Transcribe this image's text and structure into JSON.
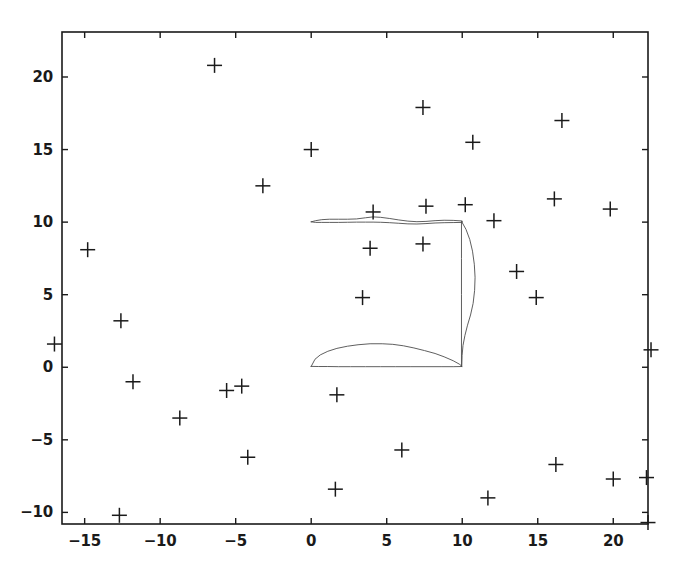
{
  "chart_data": {
    "type": "scatter",
    "title": "",
    "xlabel": "",
    "ylabel": "",
    "grid": false,
    "legend": null,
    "marker": "plus",
    "marker_color": "#1a1a1a",
    "line_color": "#4d4d4d",
    "frame_color": "#1a1a1a",
    "xlim": [
      -16.5,
      22.3
    ],
    "ylim": [
      -10.8,
      23.1
    ],
    "xticks": [
      -15,
      -10,
      -5,
      0,
      5,
      10,
      15,
      20
    ],
    "yticks": [
      -10,
      -5,
      0,
      5,
      10,
      15,
      20
    ],
    "xticklabels": [
      "-15",
      "-10",
      "-5",
      "0",
      "5",
      "10",
      "15",
      "20"
    ],
    "yticklabels": [
      "-10",
      "-5",
      "0",
      "5",
      "10",
      "15",
      "20"
    ],
    "points": [
      [
        -6.4,
        20.8
      ],
      [
        7.4,
        17.9
      ],
      [
        16.6,
        17.0
      ],
      [
        0.0,
        15.0
      ],
      [
        10.7,
        15.5
      ],
      [
        -3.2,
        12.5
      ],
      [
        4.1,
        10.7
      ],
      [
        7.6,
        11.1
      ],
      [
        10.2,
        11.2
      ],
      [
        16.1,
        11.6
      ],
      [
        19.8,
        10.9
      ],
      [
        12.1,
        10.1
      ],
      [
        -14.8,
        8.1
      ],
      [
        3.9,
        8.2
      ],
      [
        7.4,
        8.5
      ],
      [
        13.6,
        6.6
      ],
      [
        3.4,
        4.8
      ],
      [
        14.9,
        4.8
      ],
      [
        -12.6,
        3.2
      ],
      [
        -17.0,
        1.6
      ],
      [
        22.5,
        1.2
      ],
      [
        -11.8,
        -1.0
      ],
      [
        -5.6,
        -1.6
      ],
      [
        -4.6,
        -1.3
      ],
      [
        1.7,
        -1.9
      ],
      [
        -8.7,
        -3.5
      ],
      [
        -4.2,
        -6.2
      ],
      [
        6.0,
        -5.7
      ],
      [
        16.2,
        -6.7
      ],
      [
        1.6,
        -8.4
      ],
      [
        11.7,
        -9.0
      ],
      [
        20.0,
        -7.7
      ],
      [
        22.2,
        -7.6
      ],
      [
        -12.7,
        -10.2
      ],
      [
        22.3,
        -10.7
      ]
    ],
    "shapes": [
      {
        "name": "upper-airfoil-outline",
        "description": "thin near-flat airfoil along y=10 from x=0 to x=10",
        "closed": true,
        "points": [
          [
            0.0,
            10.02
          ],
          [
            0.3,
            10.1
          ],
          [
            0.7,
            10.17
          ],
          [
            1.2,
            10.2
          ],
          [
            1.8,
            10.2
          ],
          [
            2.4,
            10.2
          ],
          [
            3.0,
            10.22
          ],
          [
            3.6,
            10.3
          ],
          [
            4.1,
            10.36
          ],
          [
            4.6,
            10.33
          ],
          [
            5.2,
            10.25
          ],
          [
            5.8,
            10.15
          ],
          [
            6.4,
            10.07
          ],
          [
            7.0,
            10.03
          ],
          [
            7.6,
            10.05
          ],
          [
            8.2,
            10.1
          ],
          [
            8.8,
            10.13
          ],
          [
            9.4,
            10.12
          ],
          [
            10.0,
            10.08
          ],
          [
            10.0,
            9.98
          ],
          [
            9.4,
            9.97
          ],
          [
            8.8,
            9.96
          ],
          [
            8.2,
            9.94
          ],
          [
            7.6,
            9.9
          ],
          [
            7.0,
            9.87
          ],
          [
            6.4,
            9.88
          ],
          [
            5.8,
            9.92
          ],
          [
            5.2,
            9.96
          ],
          [
            4.6,
            9.99
          ],
          [
            4.1,
            10.0
          ],
          [
            3.6,
            10.0
          ],
          [
            3.0,
            10.0
          ],
          [
            2.4,
            9.99
          ],
          [
            1.8,
            9.98
          ],
          [
            1.2,
            9.98
          ],
          [
            0.7,
            9.98
          ],
          [
            0.3,
            9.98
          ],
          [
            0.0,
            10.02
          ]
        ]
      },
      {
        "name": "lower-airfoil-outline",
        "description": "cambered airfoil section along y=0 from x=0 to x=10",
        "closed": true,
        "points": [
          [
            0.0,
            0.06
          ],
          [
            0.25,
            0.55
          ],
          [
            0.6,
            0.85
          ],
          [
            1.1,
            1.1
          ],
          [
            1.7,
            1.3
          ],
          [
            2.4,
            1.45
          ],
          [
            3.1,
            1.55
          ],
          [
            3.9,
            1.62
          ],
          [
            4.7,
            1.62
          ],
          [
            5.4,
            1.58
          ],
          [
            6.1,
            1.48
          ],
          [
            6.8,
            1.33
          ],
          [
            7.5,
            1.15
          ],
          [
            8.2,
            0.95
          ],
          [
            8.8,
            0.72
          ],
          [
            9.4,
            0.45
          ],
          [
            9.8,
            0.22
          ],
          [
            10.0,
            0.05
          ],
          [
            9.4,
            0.04
          ],
          [
            8.6,
            0.04
          ],
          [
            7.6,
            0.04
          ],
          [
            6.6,
            0.04
          ],
          [
            5.6,
            0.04
          ],
          [
            4.6,
            0.04
          ],
          [
            3.6,
            0.04
          ],
          [
            2.6,
            0.04
          ],
          [
            1.8,
            0.04
          ],
          [
            1.1,
            0.05
          ],
          [
            0.5,
            0.05
          ],
          [
            0.0,
            0.06
          ]
        ]
      },
      {
        "name": "right-vertical-strut",
        "description": "vertical line at x=10 from y=0 to y=10",
        "closed": false,
        "points": [
          [
            9.95,
            10.05
          ],
          [
            9.95,
            7.5
          ],
          [
            9.95,
            5.0
          ],
          [
            9.95,
            2.5
          ],
          [
            9.95,
            0.05
          ]
        ]
      },
      {
        "name": "right-curved-blade",
        "description": "curved blade bulging right of x=10 between y=0 and y=10",
        "closed": false,
        "points": [
          [
            9.98,
            10.0
          ],
          [
            10.25,
            9.5
          ],
          [
            10.5,
            8.8
          ],
          [
            10.68,
            8.0
          ],
          [
            10.8,
            7.1
          ],
          [
            10.85,
            6.2
          ],
          [
            10.82,
            5.3
          ],
          [
            10.72,
            4.4
          ],
          [
            10.55,
            3.6
          ],
          [
            10.35,
            2.9
          ],
          [
            10.18,
            2.2
          ],
          [
            10.05,
            1.5
          ],
          [
            9.99,
            0.8
          ],
          [
            9.97,
            0.1
          ]
        ]
      }
    ]
  },
  "axes": {
    "frame_left_px": 62,
    "frame_right_px": 648,
    "frame_top_px": 32,
    "frame_bottom_px": 524
  }
}
